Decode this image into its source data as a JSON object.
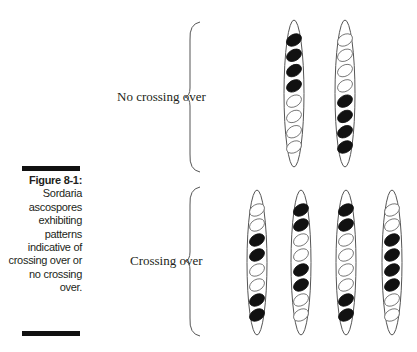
{
  "caption": {
    "title": "Figure 8-1:",
    "text": "Sordaria ascospores exhibiting patterns indicative of crossing over or no crossing over."
  },
  "groups": [
    {
      "label": "No crossing over",
      "asci": [
        [
          "black",
          "black",
          "black",
          "black",
          "white",
          "white",
          "white",
          "white"
        ],
        [
          "white",
          "white",
          "white",
          "white",
          "black",
          "black",
          "black",
          "black"
        ]
      ]
    },
    {
      "label": "Crossing over",
      "asci": [
        [
          "white",
          "white",
          "black",
          "black",
          "white",
          "white",
          "black",
          "black"
        ],
        [
          "black",
          "black",
          "white",
          "white",
          "black",
          "black",
          "white",
          "white"
        ],
        [
          "black",
          "black",
          "white",
          "white",
          "white",
          "white",
          "black",
          "black"
        ],
        [
          "white",
          "white",
          "black",
          "black",
          "black",
          "black",
          "white",
          "white"
        ]
      ]
    }
  ],
  "colors": {
    "spore_black": "#111111",
    "outline": "#555555"
  }
}
